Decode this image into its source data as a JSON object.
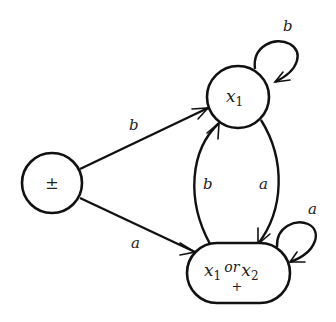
{
  "diagram": {
    "type": "finite-automaton",
    "nodes": [
      {
        "id": "start",
        "label": "±",
        "role": "start-and-final"
      },
      {
        "id": "x1",
        "label_base": "x",
        "label_sub": "1"
      },
      {
        "id": "x1_or_x2",
        "label_base1": "x",
        "label_sub1": "1",
        "label_mid": "or",
        "label_base2": "x",
        "label_sub2": "2",
        "final_mark": "+"
      }
    ],
    "edges": [
      {
        "from": "start",
        "to": "x1",
        "label": "b"
      },
      {
        "from": "start",
        "to": "x1_or_x2",
        "label": "a"
      },
      {
        "from": "x1_or_x2",
        "to": "x1",
        "label": "b"
      },
      {
        "from": "x1",
        "to": "x1_or_x2",
        "label": "a"
      },
      {
        "from": "x1",
        "to": "x1",
        "label": "b"
      },
      {
        "from": "x1_or_x2",
        "to": "x1_or_x2",
        "label": "a"
      }
    ],
    "colors": {
      "stroke": "#111111",
      "background": "#ffffff",
      "text": "#222222"
    }
  }
}
